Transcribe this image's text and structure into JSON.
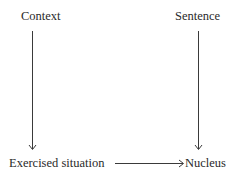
{
  "diagram": {
    "nodes": [
      {
        "id": "context",
        "label": "Context"
      },
      {
        "id": "sentence",
        "label": "Sentence"
      },
      {
        "id": "exercised_situation",
        "label": "Exercised situation"
      },
      {
        "id": "nucleus",
        "label": "Nucleus"
      }
    ],
    "edges": [
      {
        "from": "context",
        "to": "exercised_situation"
      },
      {
        "from": "sentence",
        "to": "nucleus"
      },
      {
        "from": "exercised_situation",
        "to": "nucleus"
      }
    ],
    "colors": {
      "text": "#2a2a2a",
      "line": "#3a3a3a",
      "background": "#ffffff"
    }
  }
}
